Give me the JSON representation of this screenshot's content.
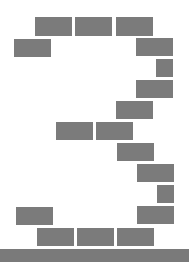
{
  "scene": {
    "description": "Digit 3 formed by gray brick blocks on a ground bar",
    "digit": "3",
    "colors": {
      "block": "#7b7b7b",
      "ground": "#7a7a7a",
      "background": "#ffffff"
    },
    "blocks": [
      {
        "x": 35,
        "y": 17,
        "w": 37,
        "h": 19
      },
      {
        "x": 75,
        "y": 17,
        "w": 37,
        "h": 19
      },
      {
        "x": 116,
        "y": 17,
        "w": 37,
        "h": 19
      },
      {
        "x": 14,
        "y": 39,
        "w": 37,
        "h": 18
      },
      {
        "x": 136,
        "y": 38,
        "w": 37,
        "h": 18
      },
      {
        "x": 156,
        "y": 59,
        "w": 17,
        "h": 18
      },
      {
        "x": 136,
        "y": 80,
        "w": 37,
        "h": 18
      },
      {
        "x": 116,
        "y": 101,
        "w": 37,
        "h": 18
      },
      {
        "x": 56,
        "y": 122,
        "w": 37,
        "h": 18
      },
      {
        "x": 96,
        "y": 122,
        "w": 37,
        "h": 18
      },
      {
        "x": 117,
        "y": 143,
        "w": 37,
        "h": 18
      },
      {
        "x": 137,
        "y": 164,
        "w": 37,
        "h": 18
      },
      {
        "x": 157,
        "y": 185,
        "w": 17,
        "h": 18
      },
      {
        "x": 16,
        "y": 207,
        "w": 37,
        "h": 18
      },
      {
        "x": 137,
        "y": 206,
        "w": 37,
        "h": 18
      },
      {
        "x": 37,
        "y": 228,
        "w": 37,
        "h": 18
      },
      {
        "x": 77,
        "y": 228,
        "w": 37,
        "h": 18
      },
      {
        "x": 117,
        "y": 228,
        "w": 37,
        "h": 18
      }
    ],
    "ground": {
      "x": 0,
      "y": 249,
      "w": 189,
      "h": 13
    }
  }
}
